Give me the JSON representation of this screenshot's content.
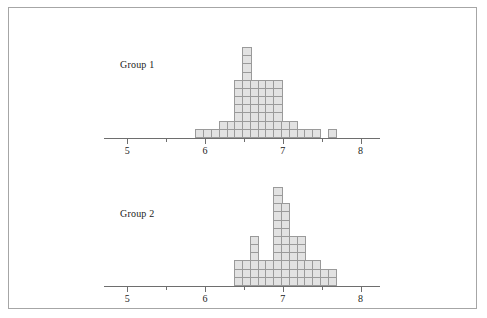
{
  "figure": {
    "width": 487,
    "height": 318,
    "background": "#ffffff",
    "frame_color": "#a6a6a6",
    "block_fill": "#e2e2e2",
    "block_stroke": "#9a9a9a",
    "axis_color": "#6e6e6e",
    "text_color": "#1b1b1b"
  },
  "chart_data": [
    {
      "type": "bar",
      "title": "Group 1",
      "label": "Group 1",
      "xlabel": "",
      "ylabel": "",
      "xlim": [
        4.7,
        8.25
      ],
      "ylim": [
        0,
        11
      ],
      "grid": false,
      "legend": "none",
      "bin_width": 0.1,
      "tick_values": [
        5,
        5.5,
        6,
        6.5,
        7,
        7.5,
        8
      ],
      "tick_labels": [
        "5",
        "",
        "6",
        "",
        "7",
        "",
        "8"
      ],
      "major_ticks": [
        5,
        6,
        7,
        8
      ],
      "minor_ticks": [
        5.5,
        6.5,
        7.5
      ],
      "x": [
        5.95,
        6.05,
        6.15,
        6.25,
        6.35,
        6.45,
        6.55,
        6.65,
        6.75,
        6.85,
        6.95,
        7.05,
        7.15,
        7.25,
        7.35,
        7.45,
        7.65
      ],
      "values": [
        1,
        1,
        1,
        2,
        2,
        7,
        11,
        7,
        7,
        7,
        7,
        2,
        2,
        1,
        1,
        1,
        1
      ],
      "total_count": 61
    },
    {
      "type": "bar",
      "title": "Group 2",
      "label": "Group 2",
      "xlabel": "",
      "ylabel": "",
      "xlim": [
        4.7,
        8.25
      ],
      "ylim": [
        0,
        12
      ],
      "grid": false,
      "legend": "none",
      "bin_width": 0.1,
      "tick_values": [
        5,
        5.5,
        6,
        6.5,
        7,
        7.5,
        8
      ],
      "tick_labels": [
        "5",
        "",
        "6",
        "",
        "7",
        "",
        "8"
      ],
      "major_ticks": [
        5,
        6,
        7,
        8
      ],
      "minor_ticks": [
        5.5,
        6.5,
        7.5
      ],
      "x": [
        6.45,
        6.55,
        6.65,
        6.75,
        6.85,
        6.95,
        7.05,
        7.15,
        7.25,
        7.35,
        7.45,
        7.55,
        7.65
      ],
      "values": [
        3,
        3,
        6,
        3,
        3,
        12,
        10,
        6,
        6,
        3,
        3,
        2,
        2
      ],
      "total_count": 62
    }
  ],
  "panels": [
    {
      "name": "group-1",
      "label": "Group 1"
    },
    {
      "name": "group-2",
      "label": "Group 2"
    }
  ]
}
